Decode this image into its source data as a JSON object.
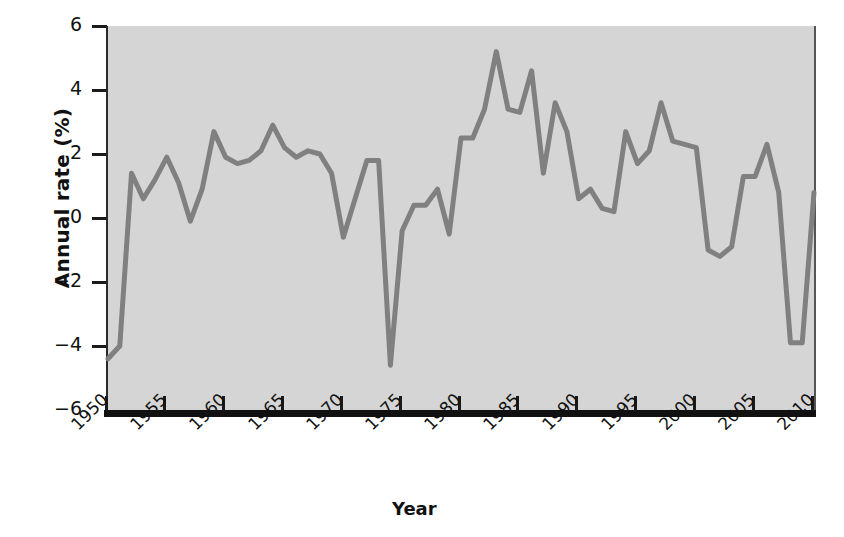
{
  "chart_data": {
    "type": "line",
    "title": "",
    "xlabel": "Year",
    "ylabel": "Annual rate (%)",
    "xlim": [
      1950,
      2010
    ],
    "ylim": [
      -6,
      6
    ],
    "xticks": [
      1950,
      1955,
      1960,
      1965,
      1970,
      1975,
      1980,
      1985,
      1990,
      1995,
      2000,
      2005,
      2010
    ],
    "yticks": [
      -6,
      -4,
      -2,
      0,
      2,
      4,
      6
    ],
    "xtick_labels": [
      "1950",
      "1955",
      "1960",
      "1965",
      "1970",
      "1975",
      "1980",
      "1985",
      "1990",
      "1995",
      "2000",
      "2005",
      "2010"
    ],
    "ytick_labels": [
      "6",
      "4",
      "2",
      "0",
      "−2",
      "−4",
      "−6"
    ],
    "grid": false,
    "legend": false,
    "line_color": "#808080",
    "plot_background": "#d5d5d5",
    "axis_color": "#111111",
    "x": [
      1950,
      1951,
      1952,
      1953,
      1954,
      1955,
      1956,
      1957,
      1958,
      1959,
      1960,
      1961,
      1962,
      1963,
      1964,
      1965,
      1966,
      1967,
      1968,
      1969,
      1970,
      1971,
      1972,
      1973,
      1974,
      1975,
      1976,
      1977,
      1978,
      1979,
      1980,
      1981,
      1982,
      1983,
      1984,
      1985,
      1986,
      1987,
      1988,
      1989,
      1990,
      1991,
      1992,
      1993,
      1994,
      1995,
      1996,
      1997,
      1998,
      1999,
      2000,
      2001,
      2002,
      2003,
      2004,
      2005,
      2006,
      2007,
      2008,
      2009,
      2010
    ],
    "values": [
      -4.4,
      -4.0,
      1.4,
      0.6,
      1.2,
      1.9,
      1.1,
      -0.1,
      0.9,
      2.7,
      1.9,
      1.7,
      1.8,
      2.1,
      2.9,
      2.2,
      1.9,
      2.1,
      2.0,
      1.4,
      -0.6,
      0.6,
      1.8,
      1.8,
      -4.6,
      -0.4,
      0.4,
      0.4,
      0.9,
      -0.5,
      2.5,
      2.5,
      3.4,
      5.2,
      3.4,
      3.3,
      4.6,
      1.4,
      3.6,
      2.7,
      0.6,
      0.9,
      0.3,
      0.2,
      2.7,
      1.7,
      2.1,
      3.6,
      2.4,
      2.3,
      2.2,
      -1.0,
      -1.2,
      -0.9,
      1.3,
      1.3,
      2.3,
      0.8,
      -3.9,
      -3.9,
      0.8
    ],
    "series_name": "Annual rate (%)"
  },
  "axes": {
    "ylabel": "Annual rate (%)",
    "xlabel": "Year"
  }
}
